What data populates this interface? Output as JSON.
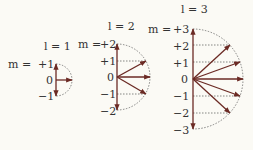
{
  "colors": {
    "arrow": "#6b2a24",
    "dashed": "#555555",
    "text": "#333333",
    "background": "#fbfaf5"
  },
  "diagrams": [
    {
      "l_label": "l = 1",
      "m_prefix": "m = ",
      "m_values": [
        "+1",
        "0",
        "−1"
      ],
      "origin": [
        56,
        80
      ],
      "radius": 16
    },
    {
      "l_label": "l = 2",
      "m_prefix": "m = ",
      "m_values": [
        "+2",
        "+1",
        "0",
        "−1",
        "−2"
      ],
      "origin": [
        117,
        77
      ],
      "radius": 33
    },
    {
      "l_label": "l = 3",
      "m_prefix": "m = ",
      "m_values": [
        "+3",
        "+2",
        "+1",
        "0",
        "−1",
        "−2",
        "−3"
      ],
      "origin": [
        193,
        79
      ],
      "radius": 50
    }
  ]
}
